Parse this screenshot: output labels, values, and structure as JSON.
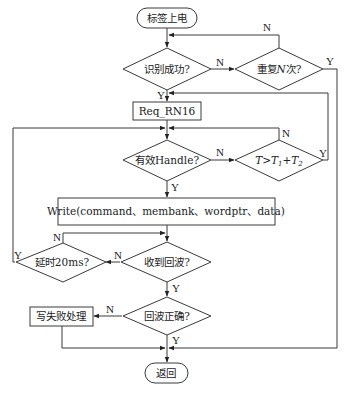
{
  "diagram": {
    "type": "flowchart",
    "nodes": {
      "start": {
        "label": "标签上电",
        "shape": "terminal"
      },
      "identify": {
        "label": "识别成功?",
        "shape": "decision"
      },
      "repeat": {
        "label": "重复N次?",
        "shape": "decision"
      },
      "req": {
        "label": "Req_RN16",
        "shape": "process"
      },
      "handle": {
        "label": "有效Handle?",
        "shape": "decision"
      },
      "timeout": {
        "label": "T>T1+T2",
        "shape": "decision"
      },
      "write": {
        "label": "Write(command、membank、wordptr、data)",
        "shape": "process"
      },
      "echo": {
        "label": "收到回波?",
        "shape": "decision"
      },
      "delay": {
        "label": "延时20ms?",
        "shape": "decision"
      },
      "verify": {
        "label": "回波正确?",
        "shape": "decision"
      },
      "fail": {
        "label": "写失败处理",
        "shape": "process"
      },
      "end": {
        "label": "返回",
        "shape": "terminal"
      }
    },
    "repeat_parts": {
      "pre": "重复",
      "var": "N",
      "post": "次?"
    },
    "timeout_parts": {
      "t": "T",
      "gt": ">",
      "t1": "T",
      "s1": "1",
      "plus": "+",
      "t2": "T",
      "s2": "2"
    },
    "edge_labels": {
      "yes": "Y",
      "no": "N"
    },
    "edges": [
      {
        "from": "start",
        "to": "identify"
      },
      {
        "from": "identify",
        "to": "repeat",
        "label": "N"
      },
      {
        "from": "identify",
        "to": "req",
        "label": "Y"
      },
      {
        "from": "repeat",
        "to": "identify",
        "label": "N"
      },
      {
        "from": "repeat",
        "to": "end",
        "label": "Y"
      },
      {
        "from": "req",
        "to": "handle"
      },
      {
        "from": "handle",
        "to": "timeout",
        "label": "N"
      },
      {
        "from": "handle",
        "to": "write",
        "label": "Y"
      },
      {
        "from": "timeout",
        "to": "handle",
        "label": "N"
      },
      {
        "from": "timeout",
        "to": "req",
        "label": "Y"
      },
      {
        "from": "write",
        "to": "echo"
      },
      {
        "from": "echo",
        "to": "delay",
        "label": "N"
      },
      {
        "from": "echo",
        "to": "verify",
        "label": "Y"
      },
      {
        "from": "delay",
        "to": "echo",
        "label": "N"
      },
      {
        "from": "delay",
        "to": "handle",
        "label": "Y"
      },
      {
        "from": "verify",
        "to": "fail",
        "label": "N"
      },
      {
        "from": "verify",
        "to": "end",
        "label": "Y"
      },
      {
        "from": "fail",
        "to": "end"
      }
    ]
  }
}
